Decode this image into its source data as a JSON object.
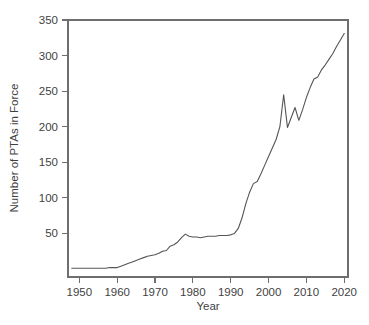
{
  "chart_data": {
    "type": "line",
    "title": "",
    "subtitle": "",
    "xlabel": "Year",
    "ylabel": "Number of PTAs in Force",
    "xlim": [
      1947,
      2021
    ],
    "ylim": [
      0,
      350
    ],
    "grid": false,
    "legend": null,
    "legend_position": "none",
    "xticks": [
      1950,
      1960,
      1970,
      1980,
      1990,
      2000,
      2010,
      2020
    ],
    "xtick_labels": [
      "1950",
      "1960",
      "1970",
      "1980",
      "1990",
      "2000",
      "2010",
      "2020"
    ],
    "yticks": [
      50,
      100,
      150,
      200,
      250,
      300,
      350
    ],
    "ytick_labels": [
      "50",
      "100",
      "150",
      "200",
      "250",
      "300",
      "350"
    ],
    "series": [
      {
        "name": "Number of PTAs in Force",
        "color": "#555555",
        "x": [
          1948,
          1949,
          1950,
          1951,
          1952,
          1953,
          1954,
          1955,
          1956,
          1957,
          1958,
          1959,
          1960,
          1961,
          1962,
          1963,
          1964,
          1965,
          1966,
          1967,
          1968,
          1969,
          1970,
          1971,
          1972,
          1973,
          1974,
          1975,
          1976,
          1977,
          1978,
          1979,
          1980,
          1981,
          1982,
          1983,
          1984,
          1985,
          1986,
          1987,
          1988,
          1989,
          1990,
          1991,
          1992,
          1993,
          1994,
          1995,
          1996,
          1997,
          1998,
          1999,
          2000,
          2001,
          2002,
          2003,
          2004,
          2005,
          2006,
          2007,
          2008,
          2009,
          2010,
          2011,
          2012,
          2013,
          2014,
          2015,
          2016,
          2017,
          2018,
          2019,
          2020
        ],
        "y": [
          1,
          1,
          1,
          1,
          1,
          1,
          1,
          1,
          1,
          1,
          2,
          2,
          2,
          4,
          6,
          8,
          10,
          12,
          14,
          16,
          18,
          19,
          20,
          22,
          25,
          26,
          32,
          34,
          38,
          44,
          49,
          46,
          45,
          45,
          44,
          45,
          46,
          46,
          46,
          47,
          47,
          47,
          48,
          50,
          57,
          72,
          92,
          108,
          120,
          123,
          134,
          146,
          158,
          170,
          182,
          200,
          245,
          199,
          213,
          227,
          209,
          224,
          241,
          255,
          267,
          270,
          280,
          287,
          295,
          303,
          313,
          322,
          331
        ]
      }
    ]
  },
  "axes": {
    "x_title": "Year",
    "y_title": "Number of PTAs in Force"
  },
  "colors": {
    "line": "#555555",
    "axis": "#6e6e6e",
    "text": "#3f3f3f",
    "background": "#ffffff"
  }
}
